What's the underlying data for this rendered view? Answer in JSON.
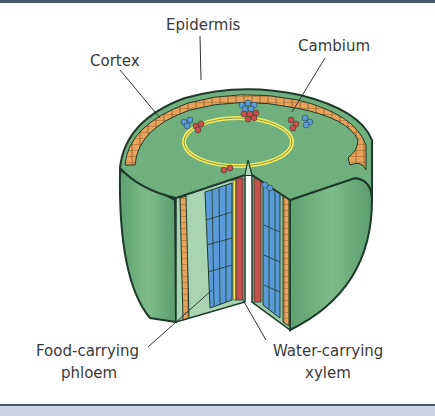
{
  "diagram": {
    "labels": {
      "epidermis": "Epidermis",
      "cortex": "Cortex",
      "cambium": "Cambium",
      "phloem_line1": "Food-carrying",
      "phloem_line2": "phloem",
      "xylem_line1": "Water-carrying",
      "xylem_line2": "xylem"
    },
    "colors": {
      "cortex_green": "#6fb07e",
      "epidermis_orange": "#e8a25a",
      "cambium_yellow": "#f2ea5c",
      "phloem_red": "#c9504a",
      "xylem_blue": "#5a9ad8",
      "outline": "#1f3a2a",
      "frame_dark": "#4a5870",
      "frame_light": "#c9d4e4"
    }
  }
}
